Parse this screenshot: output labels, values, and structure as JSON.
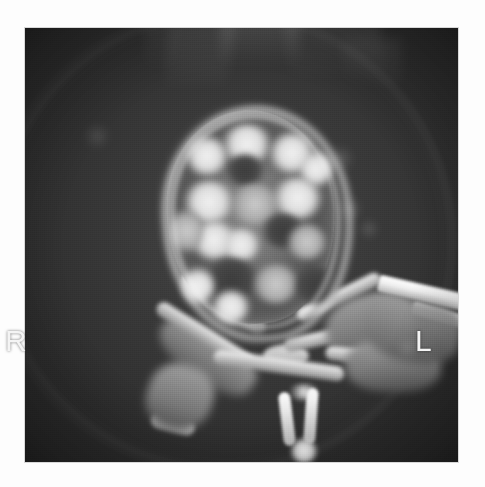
{
  "image": {
    "modality": "CT",
    "plane": "axial",
    "subject": "vertebra",
    "frame": {
      "left": 25,
      "top": 28,
      "width": 433,
      "height": 434
    },
    "background_color": "#303030",
    "border_color": "#ffffff"
  },
  "markers": {
    "right": {
      "label": "R",
      "meaning": "patient right side",
      "x": 30,
      "y": 354
    },
    "left": {
      "label": "L",
      "meaning": "patient left side",
      "x": 440,
      "y": 354
    }
  },
  "anatomy": {
    "vertebral_body": {
      "name": "vertebral body",
      "appearance": "mottled sclerotic / coarse trabecular",
      "bounds": {
        "left": 142,
        "top": 82,
        "width": 168,
        "height": 214
      }
    },
    "pedicle_right": {
      "name": "right pedicle"
    },
    "pedicle_left": {
      "name": "left pedicle"
    },
    "lamina_right": {
      "name": "right lamina"
    },
    "lamina_left": {
      "name": "left lamina"
    },
    "spinous_process": {
      "name": "spinous process",
      "appearance": "bright V-shaped cortex"
    },
    "transverse_process_left": {
      "name": "left transverse process / rib",
      "appearance": "bright linear band"
    },
    "transverse_process_right": {
      "name": "right transverse process"
    },
    "spinal_canal": {
      "name": "spinal canal"
    }
  },
  "artifacts": {
    "scan_field_circle": "circular scan-field boundary arc",
    "beam_streaks": "vertical lighter streak bands along the superior margin",
    "film_grain": "analog film grain texture"
  },
  "soft_tissue_nodules": [
    {
      "x": 338,
      "y": 158,
      "r": 13
    },
    {
      "x": 350,
      "y": 208,
      "r": 11
    },
    {
      "x": 368,
      "y": 228,
      "r": 9
    },
    {
      "x": 96,
      "y": 132,
      "r": 12
    }
  ],
  "palette": {
    "film_base": "#303030",
    "soft_tissue": "#3b3b3b",
    "bone_cortex": "#f2f2f2",
    "bone_marrow": "#8e8e8e",
    "marker_text": "#f4f4f4",
    "paper": "#ffffff"
  }
}
